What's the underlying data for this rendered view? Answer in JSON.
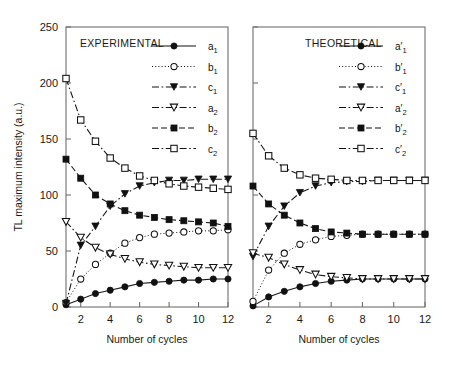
{
  "figure": {
    "ylabel": "TL maximum intensity (a.u.)",
    "y_ticks": [
      "0",
      "50",
      "100",
      "150",
      "200",
      "250"
    ],
    "x_ticks": [
      "2",
      "4",
      "6",
      "8",
      "10",
      "12"
    ],
    "xlabel_left": "Number of cycles",
    "xlabel_right": "Number of cycles",
    "panel_left_title": "EXPERIMENTAL",
    "panel_right_title": "THEORETICAL"
  },
  "legend_left": [
    {
      "base": "a",
      "sub": "1",
      "prime": "",
      "marker": "filled-circle",
      "dash": "solid"
    },
    {
      "base": "b",
      "sub": "1",
      "prime": "",
      "marker": "open-circle",
      "dash": "dotted"
    },
    {
      "base": "c",
      "sub": "1",
      "prime": "",
      "marker": "filled-triangle-down",
      "dash": "dashdot"
    },
    {
      "base": "a",
      "sub": "2",
      "prime": "",
      "marker": "open-triangle-down",
      "dash": "dashdot"
    },
    {
      "base": "b",
      "sub": "2",
      "prime": "",
      "marker": "filled-square",
      "dash": "dashed"
    },
    {
      "base": "c",
      "sub": "2",
      "prime": "",
      "marker": "open-square",
      "dash": "dashdot"
    }
  ],
  "legend_right": [
    {
      "base": "a",
      "sub": "1",
      "prime": "′",
      "marker": "filled-circle",
      "dash": "solid"
    },
    {
      "base": "b",
      "sub": "1",
      "prime": "′",
      "marker": "open-circle",
      "dash": "dotted"
    },
    {
      "base": "c",
      "sub": "1",
      "prime": "′",
      "marker": "filled-triangle-down",
      "dash": "dashdot"
    },
    {
      "base": "a",
      "sub": "2",
      "prime": "′",
      "marker": "open-triangle-down",
      "dash": "dashdot"
    },
    {
      "base": "b",
      "sub": "2",
      "prime": "′",
      "marker": "filled-square",
      "dash": "dashed"
    },
    {
      "base": "c",
      "sub": "2",
      "prime": "′",
      "marker": "open-square",
      "dash": "dashdot"
    }
  ],
  "chart_data": [
    {
      "type": "line",
      "title": "EXPERIMENTAL",
      "xlabel": "Number of cycles",
      "ylabel": "TL maximum intensity (a.u.)",
      "xlim": [
        1,
        12
      ],
      "ylim": [
        0,
        250
      ],
      "x": [
        1,
        2,
        3,
        4,
        5,
        6,
        7,
        8,
        9,
        10,
        11,
        12
      ],
      "grid": false,
      "legend_position": "top-right",
      "series": [
        {
          "name": "a1",
          "marker": "filled-circle",
          "dash": "solid",
          "values": [
            2,
            7,
            12,
            15,
            18,
            21,
            22,
            23,
            24,
            24,
            25,
            25
          ]
        },
        {
          "name": "b1",
          "marker": "open-circle",
          "dash": "dotted",
          "values": [
            4,
            25,
            38,
            48,
            57,
            62,
            65,
            66,
            67,
            68,
            68,
            69
          ]
        },
        {
          "name": "c1",
          "marker": "filled-triangle-down",
          "dash": "dashdot",
          "values": [
            3,
            55,
            72,
            90,
            101,
            108,
            111,
            113,
            113,
            114,
            114,
            114
          ]
        },
        {
          "name": "a2",
          "marker": "open-triangle-down",
          "dash": "dashdot",
          "values": [
            76,
            62,
            53,
            47,
            43,
            40,
            38,
            37,
            36,
            35,
            35,
            35
          ]
        },
        {
          "name": "b2",
          "marker": "filled-square",
          "dash": "dashed",
          "values": [
            132,
            115,
            100,
            92,
            86,
            82,
            80,
            78,
            77,
            76,
            75,
            72
          ]
        },
        {
          "name": "c2",
          "marker": "open-square",
          "dash": "dashdot",
          "values": [
            204,
            167,
            148,
            133,
            124,
            117,
            113,
            110,
            108,
            107,
            106,
            105
          ]
        }
      ]
    },
    {
      "type": "line",
      "title": "THEORETICAL",
      "xlabel": "Number of cycles",
      "ylabel": "TL maximum intensity (a.u.)",
      "xlim": [
        1,
        12
      ],
      "ylim": [
        0,
        250
      ],
      "x": [
        1,
        2,
        3,
        4,
        5,
        6,
        7,
        8,
        9,
        10,
        11,
        12
      ],
      "grid": false,
      "legend_position": "top-right",
      "series": [
        {
          "name": "a'1",
          "marker": "filled-circle",
          "dash": "solid",
          "values": [
            1,
            9,
            14,
            18,
            21,
            23,
            24,
            25,
            25,
            25,
            25,
            25
          ]
        },
        {
          "name": "b'1",
          "marker": "open-circle",
          "dash": "dotted",
          "values": [
            5,
            33,
            48,
            56,
            60,
            63,
            64,
            65,
            65,
            65,
            65,
            65
          ]
        },
        {
          "name": "c'1",
          "marker": "filled-triangle-down",
          "dash": "dashdot",
          "values": [
            45,
            72,
            90,
            102,
            108,
            111,
            112,
            112,
            113,
            113,
            113,
            113
          ]
        },
        {
          "name": "a'2",
          "marker": "open-triangle-down",
          "dash": "dashdot",
          "values": [
            48,
            44,
            38,
            33,
            29,
            27,
            26,
            25,
            25,
            25,
            25,
            25
          ]
        },
        {
          "name": "b'2",
          "marker": "filled-square",
          "dash": "dashed",
          "values": [
            108,
            92,
            82,
            75,
            70,
            67,
            66,
            65,
            65,
            65,
            65,
            65
          ]
        },
        {
          "name": "c'2",
          "marker": "open-square",
          "dash": "dashdot",
          "values": [
            155,
            135,
            124,
            118,
            115,
            114,
            113,
            113,
            113,
            113,
            113,
            113
          ]
        }
      ]
    }
  ]
}
